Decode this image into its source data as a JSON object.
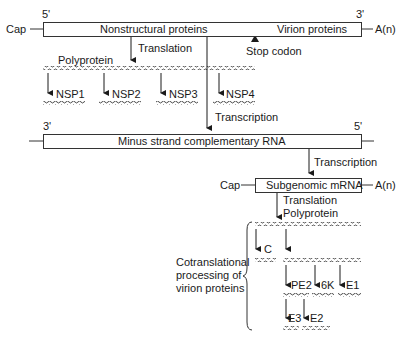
{
  "genome": {
    "five_prime": "5'",
    "three_prime": "3'",
    "cap": "Cap",
    "polya": "A(n)",
    "nonstructural": "Nonstructural proteins",
    "virion": "Virion proteins",
    "stop_codon": "Stop codon"
  },
  "translation1": {
    "label": "Translation",
    "polyprotein": "Polyprotein",
    "products": [
      "NSP1",
      "NSP2",
      "NSP3",
      "NSP4"
    ]
  },
  "transcription1": {
    "label": "Transcription"
  },
  "minus_strand": {
    "three_prime": "3'",
    "five_prime": "5'",
    "label": "Minus strand complementary RNA"
  },
  "transcription2": {
    "label": "Transcription"
  },
  "subgenomic": {
    "cap": "Cap",
    "label": "Subgenomic mRNA",
    "polya": "A(n)"
  },
  "translation2": {
    "label": "Translation",
    "polyprotein": "Polyprotein"
  },
  "processing": {
    "label": "Cotranslational\nprocessing of\nvirion proteins",
    "capsid": "C",
    "pe2": "PE2",
    "k6": "6K",
    "e1": "E1",
    "e3": "E3",
    "e2": "E2"
  }
}
